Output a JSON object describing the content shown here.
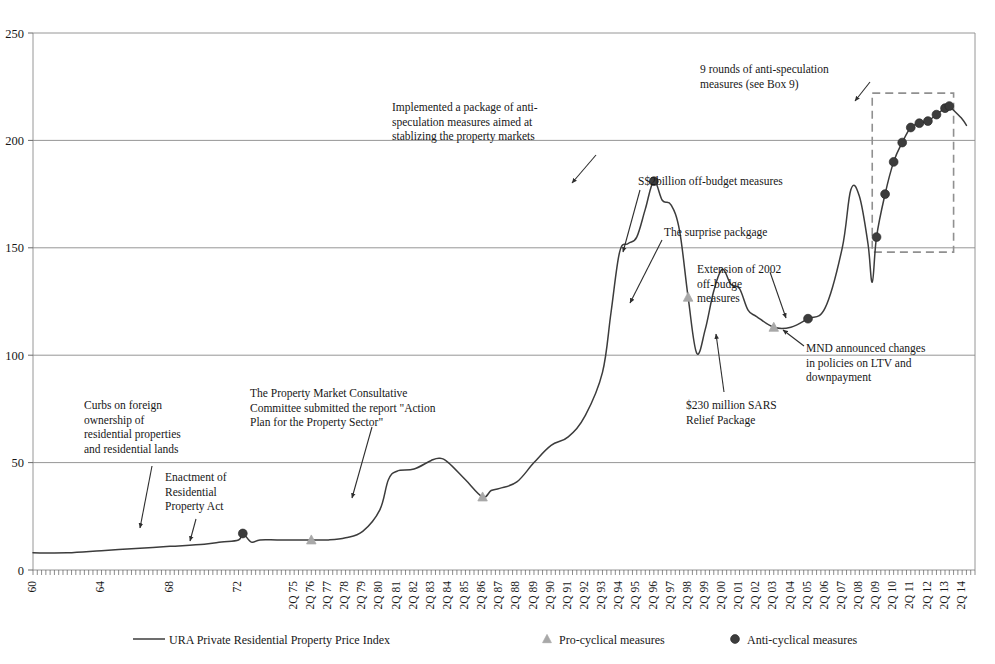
{
  "chart_data": {
    "type": "line",
    "title": "",
    "xlabel": "",
    "ylabel": "",
    "ylim": [
      0,
      250
    ],
    "yticks": [
      0,
      50,
      100,
      150,
      200,
      250
    ],
    "grid": true,
    "legend_position": "bottom",
    "xtick_labels": [
      "60",
      "64",
      "68",
      "72",
      "2Q 75",
      "2Q 76",
      "2Q 77",
      "2Q 78",
      "2Q 79",
      "2Q 80",
      "2Q 81",
      "2Q 82",
      "2Q 83",
      "2Q 84",
      "2Q 85",
      "2Q 86",
      "2Q 87",
      "2Q 88",
      "2Q 89",
      "2Q 90",
      "2Q 91",
      "2Q 92",
      "2Q 93",
      "2Q 94",
      "2Q 95",
      "2Q 96",
      "2Q 97",
      "2Q 98",
      "2Q 99",
      "2Q 00",
      "2Q 01",
      "2Q 02",
      "2Q 03",
      "2Q 04",
      "2Q 05",
      "2Q 06",
      "2Q 07",
      "2Q 08",
      "2Q 09",
      "2Q 10",
      "2Q 11",
      "2Q 12",
      "2Q 13",
      "2Q 14"
    ],
    "series": [
      {
        "name": "URA Private Residential Property Price Index",
        "color": "#3c3c3c",
        "type": "line",
        "points": [
          {
            "x": "60",
            "y": 8
          },
          {
            "x": "62",
            "y": 8
          },
          {
            "x": "64",
            "y": 9
          },
          {
            "x": "66",
            "y": 10
          },
          {
            "x": "68",
            "y": 11
          },
          {
            "x": "70",
            "y": 12
          },
          {
            "x": "71",
            "y": 13
          },
          {
            "x": "1Q 72",
            "y": 14
          },
          {
            "x": "2Q 72",
            "y": 17
          },
          {
            "x": "4Q 72",
            "y": 13
          },
          {
            "x": "2Q 73",
            "y": 14
          },
          {
            "x": "2Q 74",
            "y": 14
          },
          {
            "x": "2Q 75",
            "y": 14
          },
          {
            "x": "2Q 76",
            "y": 14
          },
          {
            "x": "2Q 77",
            "y": 14
          },
          {
            "x": "2Q 78",
            "y": 15
          },
          {
            "x": "2Q 79",
            "y": 18
          },
          {
            "x": "2Q 80",
            "y": 28
          },
          {
            "x": "4Q 80",
            "y": 42
          },
          {
            "x": "2Q 81",
            "y": 46
          },
          {
            "x": "2Q 82",
            "y": 47
          },
          {
            "x": "2Q 83",
            "y": 51
          },
          {
            "x": "4Q 83",
            "y": 52
          },
          {
            "x": "2Q 84",
            "y": 50
          },
          {
            "x": "2Q 85",
            "y": 42
          },
          {
            "x": "2Q 86",
            "y": 34
          },
          {
            "x": "4Q 86",
            "y": 37
          },
          {
            "x": "2Q 87",
            "y": 38
          },
          {
            "x": "2Q 88",
            "y": 41
          },
          {
            "x": "2Q 89",
            "y": 50
          },
          {
            "x": "2Q 90",
            "y": 58
          },
          {
            "x": "2Q 91",
            "y": 62
          },
          {
            "x": "2Q 92",
            "y": 72
          },
          {
            "x": "2Q 93",
            "y": 92
          },
          {
            "x": "4Q 93",
            "y": 120
          },
          {
            "x": "2Q 94",
            "y": 148
          },
          {
            "x": "4Q 94",
            "y": 152
          },
          {
            "x": "2Q 95",
            "y": 155
          },
          {
            "x": "4Q 95",
            "y": 168
          },
          {
            "x": "2Q 96",
            "y": 181
          },
          {
            "x": "4Q 96",
            "y": 172
          },
          {
            "x": "2Q 97",
            "y": 170
          },
          {
            "x": "4Q 97",
            "y": 158
          },
          {
            "x": "2Q 98",
            "y": 127
          },
          {
            "x": "4Q 98",
            "y": 101
          },
          {
            "x": "2Q 99",
            "y": 112
          },
          {
            "x": "4Q 99",
            "y": 130
          },
          {
            "x": "2Q 00",
            "y": 140
          },
          {
            "x": "4Q 00",
            "y": 133
          },
          {
            "x": "2Q 01",
            "y": 131
          },
          {
            "x": "4Q 01",
            "y": 121
          },
          {
            "x": "2Q 02",
            "y": 118
          },
          {
            "x": "2Q 03",
            "y": 113
          },
          {
            "x": "2Q 04",
            "y": 113
          },
          {
            "x": "2Q 05",
            "y": 117
          },
          {
            "x": "2Q 06",
            "y": 122
          },
          {
            "x": "2Q 07",
            "y": 150
          },
          {
            "x": "4Q 07",
            "y": 177
          },
          {
            "x": "2Q 08",
            "y": 174
          },
          {
            "x": "4Q 08",
            "y": 152
          },
          {
            "x": "1Q 09",
            "y": 134
          },
          {
            "x": "2Q 09",
            "y": 155
          },
          {
            "x": "4Q 09",
            "y": 175
          },
          {
            "x": "2Q 10",
            "y": 190
          },
          {
            "x": "4Q 10",
            "y": 199
          },
          {
            "x": "2Q 11",
            "y": 206
          },
          {
            "x": "4Q 11",
            "y": 208
          },
          {
            "x": "2Q 12",
            "y": 209
          },
          {
            "x": "4Q 12",
            "y": 212
          },
          {
            "x": "2Q 13",
            "y": 215
          },
          {
            "x": "3Q 13",
            "y": 216
          },
          {
            "x": "4Q 13",
            "y": 214
          },
          {
            "x": "2Q 14",
            "y": 210
          },
          {
            "x": "3Q 14",
            "y": 207
          }
        ]
      }
    ],
    "markers": [
      {
        "name": "Pro-cyclical measures",
        "symbol": "triangle",
        "color": "#a8a8a8",
        "points": [
          {
            "x": "2Q 76",
            "y": 14
          },
          {
            "x": "2Q 86",
            "y": 34
          },
          {
            "x": "2Q 98",
            "y": 127
          },
          {
            "x": "2Q 03",
            "y": 113
          }
        ]
      },
      {
        "name": "Anti-cyclical measures",
        "symbol": "circle",
        "color": "#3c3c3c",
        "points": [
          {
            "x": "2Q 72",
            "y": 17
          },
          {
            "x": "2Q 96",
            "y": 181
          },
          {
            "x": "2Q 05",
            "y": 117
          },
          {
            "x": "2Q 09",
            "y": 155
          },
          {
            "x": "4Q 09",
            "y": 175
          },
          {
            "x": "2Q 10",
            "y": 190
          },
          {
            "x": "4Q 10",
            "y": 199
          },
          {
            "x": "2Q 11",
            "y": 206
          },
          {
            "x": "4Q 11",
            "y": 208
          },
          {
            "x": "2Q 12",
            "y": 209
          },
          {
            "x": "4Q 12",
            "y": 212
          },
          {
            "x": "2Q 13",
            "y": 215
          },
          {
            "x": "3Q 13",
            "y": 216
          }
        ]
      }
    ],
    "highlight_box": {
      "label": "9 rounds of anti-speculation measures (see Box 9)",
      "x_start": "1Q 09",
      "x_end": "4Q 13",
      "y_start": 148,
      "y_end": 222,
      "style": "dashed",
      "color": "#909090"
    },
    "annotations": [
      {
        "id": "curbs-foreign-ownership",
        "text": "Curbs on foreign\nownership of\nresidential properties\nand residential lands",
        "target_x": "2Q 72",
        "target_y": 17
      },
      {
        "id": "enactment-residential-property-act",
        "text": "Enactment of\nResidential\nProperty Act",
        "target_x": "2Q 76",
        "target_y": 14
      },
      {
        "id": "property-market-consultative-committee",
        "text": "The Property Market Consultative\nCommittee submitted the report \"Action\nPlan for the Property Sector\"",
        "target_x": "2Q 86",
        "target_y": 34
      },
      {
        "id": "anti-speculation-package-1996",
        "text": "Implemented a package of anti-\nspeculation measures aimed at\nstablizing the property markets",
        "target_x": "2Q 96",
        "target_y": 181
      },
      {
        "id": "off-budget-measures-2billion",
        "text": "S$2billion off-budget measures",
        "target_x": "2Q 98",
        "target_y": 127
      },
      {
        "id": "surprise-package",
        "text": "The surprise packgage",
        "target_x": "2Q 98",
        "target_y": 127
      },
      {
        "id": "extension-2002-off-budget",
        "text": "Extension of 2002\noff-budge\nmeasures",
        "target_x": "2Q 03",
        "target_y": 113
      },
      {
        "id": "sars-relief-package",
        "text": "$230 million SARS\nRelief Package",
        "target_x": "2Q 03",
        "target_y": 113
      },
      {
        "id": "mnd-ltv-downpayment",
        "text": "MND announced changes\nin policies on LTV and\ndownpayment",
        "target_x": "2Q 05",
        "target_y": 117
      },
      {
        "id": "nine-rounds-anti-speculation",
        "text": "9 rounds of anti-speculation\nmeasures (see Box 9)",
        "target_x": "1Q 09",
        "target_y": 222
      }
    ]
  },
  "yaxis": {
    "ticks": [
      "250",
      "200",
      "150",
      "100",
      "50",
      "0"
    ]
  },
  "xaxis": {
    "labels": [
      "60",
      "64",
      "68",
      "72",
      "2Q 75",
      "2Q 76",
      "2Q 77",
      "2Q 78",
      "2Q 79",
      "2Q 80",
      "2Q 81",
      "2Q 82",
      "2Q 83",
      "2Q 84",
      "2Q 85",
      "2Q 86",
      "2Q 87",
      "2Q 88",
      "2Q 89",
      "2Q 90",
      "2Q 91",
      "2Q 92",
      "2Q 93",
      "2Q 94",
      "2Q 95",
      "2Q 96",
      "2Q 97",
      "2Q 98",
      "2Q 99",
      "2Q 00",
      "2Q 01",
      "2Q 02",
      "2Q 03",
      "2Q 04",
      "2Q 05",
      "2Q 06",
      "2Q 07",
      "2Q 08",
      "2Q 09",
      "2Q 10",
      "2Q 11",
      "2Q 12",
      "2Q 13",
      "2Q 14"
    ]
  },
  "legend": {
    "items": [
      {
        "id": "legend-line-price-index",
        "label": "URA Private Residential Property Price Index",
        "symbol": "line",
        "color": "#3c3c3c"
      },
      {
        "id": "legend-pro-cyclical",
        "label": "Pro-cyclical measures",
        "symbol": "triangle",
        "color": "#a8a8a8"
      },
      {
        "id": "legend-anti-cyclical",
        "label": "Anti-cyclical measures",
        "symbol": "circle",
        "color": "#3c3c3c"
      }
    ]
  },
  "annotation_text": {
    "curbs": "Curbs on foreign\nownership of\nresidential properties\nand residential lands",
    "enactment": "Enactment of\nResidential\nProperty Act",
    "consultative": "The Property Market Consultative\nCommittee submitted the report \"Action\nPlan for the Property Sector\"",
    "implemented": "Implemented a package of anti-\nspeculation measures aimed at\nstablizing the property markets",
    "offbudget2b": "S$2billion off-budget measures",
    "surprise": "The surprise packgage",
    "extension2002": "Extension of 2002\noff-budge\nmeasures",
    "sars": "$230 million SARS\nRelief Package",
    "mnd": "MND announced changes\nin policies on LTV and\ndownpayment",
    "ninerounds": "9 rounds of anti-speculation\nmeasures (see Box 9)"
  }
}
